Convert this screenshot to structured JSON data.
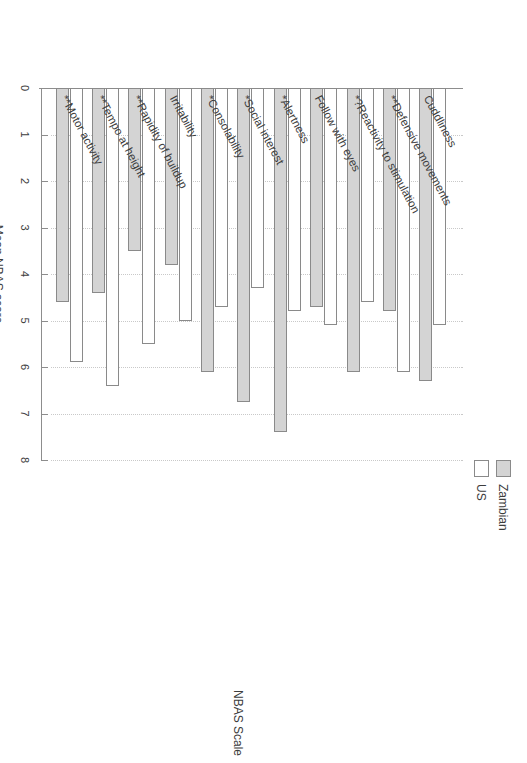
{
  "chart_data": {
    "type": "bar",
    "orientation": "horizontal",
    "title": "",
    "xlabel": "Mean NBAS score",
    "ylabel": "NBAS Scale",
    "xlim": [
      0,
      8
    ],
    "xticks": [
      "0",
      "1",
      "2",
      "3",
      "4",
      "5",
      "6",
      "7",
      "8"
    ],
    "grid": "dotted vertical gridlines",
    "legend_position": "top-left (rotated)",
    "categories": [
      "Cuddliness",
      "**Defensive movements",
      "*?Reactivity to stimulation",
      "Follow with eyes",
      "*Alertness",
      "*Social interest",
      "*Consolability",
      "Irritability",
      "**Rapidity of buildup",
      "**Tempo at height",
      "**Motor activity"
    ],
    "series": [
      {
        "name": "Zambian",
        "color": "#d4d4d4",
        "values": [
          6.3,
          4.8,
          6.1,
          4.7,
          7.4,
          6.75,
          6.1,
          3.8,
          3.5,
          4.4,
          4.6
        ]
      },
      {
        "name": "US",
        "color": "#ffffff",
        "values": [
          5.1,
          6.1,
          4.6,
          5.1,
          4.8,
          4.3,
          4.7,
          5.0,
          5.5,
          6.4,
          5.9
        ]
      }
    ]
  },
  "legend": {
    "items": [
      {
        "label": "Zambian",
        "swatch": "gray-filled-swatch"
      },
      {
        "label": "US",
        "swatch": "white-outline-swatch"
      }
    ]
  },
  "axes": {
    "value_axis_title": "Mean NBAS score",
    "category_axis_title": "NBAS Scale"
  }
}
